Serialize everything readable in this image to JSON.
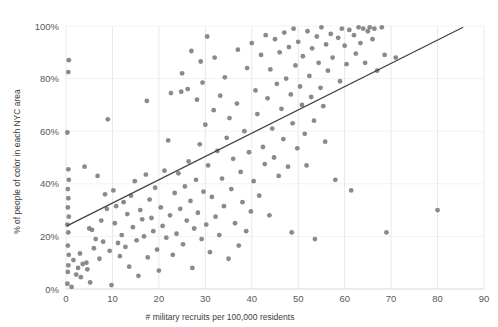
{
  "chart_data": {
    "type": "scatter",
    "title": "",
    "xlabel": "# military recruits per 100,000 residents",
    "ylabel": "% of people of color in each NYC area",
    "xlim": [
      0,
      90
    ],
    "ylim": [
      0,
      100
    ],
    "xticks": [
      0,
      10,
      20,
      30,
      40,
      50,
      60,
      70,
      80,
      90
    ],
    "xtick_labels": [
      "0",
      "10",
      "20",
      "30",
      "40",
      "50",
      "60",
      "70",
      "80",
      "90"
    ],
    "yticks": [
      0,
      20,
      40,
      60,
      80,
      100
    ],
    "ytick_labels": [
      "0%",
      "20%",
      "40%",
      "60%",
      "80%",
      "100%"
    ],
    "grid": {
      "vertical": true,
      "horizontal": true
    },
    "legend": null,
    "marker": {
      "shape": "circle",
      "color": "#808080",
      "size": 2.4
    },
    "trendline": {
      "type": "linear",
      "color": "#3f3f3f",
      "x_start": 0.2,
      "y_start": 24.0,
      "x_end": 85.5,
      "y_end": 99.5
    },
    "point_count": 201,
    "points": [
      [
        0.3,
        2.0
      ],
      [
        0.4,
        6.5
      ],
      [
        0.5,
        9.0
      ],
      [
        0.6,
        13.0
      ],
      [
        0.4,
        16.5
      ],
      [
        0.5,
        21.5
      ],
      [
        0.3,
        24.5
      ],
      [
        0.6,
        27.5
      ],
      [
        0.4,
        31.0
      ],
      [
        0.5,
        34.5
      ],
      [
        0.4,
        38.0
      ],
      [
        0.6,
        41.5
      ],
      [
        0.5,
        45.5
      ],
      [
        0.3,
        59.5
      ],
      [
        0.5,
        82.5
      ],
      [
        0.6,
        87.0
      ],
      [
        1.2,
        0.8
      ],
      [
        1.6,
        11.0
      ],
      [
        2.2,
        5.5
      ],
      [
        2.6,
        8.0
      ],
      [
        3.0,
        13.5
      ],
      [
        3.2,
        4.5
      ],
      [
        3.6,
        9.5
      ],
      [
        4.0,
        46.5
      ],
      [
        4.4,
        10.0
      ],
      [
        4.6,
        7.5
      ],
      [
        5.0,
        23.0
      ],
      [
        5.2,
        2.5
      ],
      [
        5.6,
        22.5
      ],
      [
        6.0,
        15.5
      ],
      [
        6.4,
        19.0
      ],
      [
        6.8,
        43.0
      ],
      [
        7.2,
        11.5
      ],
      [
        7.6,
        26.0
      ],
      [
        8.0,
        18.0
      ],
      [
        8.4,
        36.0
      ],
      [
        8.8,
        30.5
      ],
      [
        9.0,
        64.5
      ],
      [
        9.4,
        14.5
      ],
      [
        9.8,
        1.5
      ],
      [
        10.2,
        37.5
      ],
      [
        10.5,
        25.0
      ],
      [
        10.8,
        31.5
      ],
      [
        11.2,
        17.5
      ],
      [
        11.6,
        12.5
      ],
      [
        12.0,
        20.5
      ],
      [
        12.4,
        33.0
      ],
      [
        12.8,
        16.0
      ],
      [
        13.2,
        28.5
      ],
      [
        13.6,
        8.5
      ],
      [
        14.0,
        35.5
      ],
      [
        14.4,
        23.5
      ],
      [
        14.8,
        41.0
      ],
      [
        15.2,
        18.5
      ],
      [
        15.6,
        5.0
      ],
      [
        16.0,
        30.0
      ],
      [
        16.4,
        26.5
      ],
      [
        16.8,
        20.0
      ],
      [
        17.2,
        43.5
      ],
      [
        17.4,
        71.5
      ],
      [
        17.6,
        12.0
      ],
      [
        18.0,
        34.0
      ],
      [
        18.4,
        27.0
      ],
      [
        18.8,
        22.0
      ],
      [
        19.2,
        38.5
      ],
      [
        19.6,
        15.0
      ],
      [
        20.0,
        7.0
      ],
      [
        20.4,
        31.0
      ],
      [
        20.8,
        24.0
      ],
      [
        21.2,
        45.0
      ],
      [
        21.6,
        19.5
      ],
      [
        22.0,
        56.5
      ],
      [
        22.4,
        28.0
      ],
      [
        22.6,
        74.5
      ],
      [
        23.0,
        13.0
      ],
      [
        23.4,
        36.5
      ],
      [
        23.8,
        21.0
      ],
      [
        24.2,
        44.0
      ],
      [
        24.6,
        30.5
      ],
      [
        24.8,
        75.0
      ],
      [
        25.0,
        82.0
      ],
      [
        25.2,
        17.0
      ],
      [
        25.6,
        39.0
      ],
      [
        26.0,
        26.0
      ],
      [
        26.2,
        76.0
      ],
      [
        26.4,
        48.5
      ],
      [
        26.8,
        33.5
      ],
      [
        27.0,
        90.5
      ],
      [
        27.2,
        8.0
      ],
      [
        27.6,
        23.0
      ],
      [
        28.0,
        41.5
      ],
      [
        28.2,
        72.0
      ],
      [
        28.4,
        29.0
      ],
      [
        28.8,
        55.0
      ],
      [
        29.0,
        86.5
      ],
      [
        29.2,
        19.0
      ],
      [
        29.4,
        78.5
      ],
      [
        29.6,
        37.0
      ],
      [
        30.0,
        62.5
      ],
      [
        30.2,
        24.5
      ],
      [
        30.4,
        96.0
      ],
      [
        30.6,
        47.0
      ],
      [
        31.0,
        14.0
      ],
      [
        31.4,
        35.0
      ],
      [
        31.8,
        68.0
      ],
      [
        32.0,
        88.0
      ],
      [
        32.2,
        27.5
      ],
      [
        32.6,
        52.5
      ],
      [
        33.0,
        20.5
      ],
      [
        33.2,
        73.5
      ],
      [
        33.6,
        42.0
      ],
      [
        34.0,
        31.5
      ],
      [
        34.2,
        80.5
      ],
      [
        34.6,
        57.5
      ],
      [
        35.0,
        11.5
      ],
      [
        35.2,
        65.0
      ],
      [
        35.6,
        38.0
      ],
      [
        36.0,
        49.5
      ],
      [
        36.4,
        25.0
      ],
      [
        36.8,
        70.5
      ],
      [
        37.0,
        91.0
      ],
      [
        37.2,
        16.5
      ],
      [
        37.6,
        44.5
      ],
      [
        38.0,
        33.0
      ],
      [
        38.4,
        60.0
      ],
      [
        38.8,
        22.0
      ],
      [
        39.0,
        84.0
      ],
      [
        39.4,
        52.0
      ],
      [
        39.8,
        29.5
      ],
      [
        40.0,
        93.5
      ],
      [
        40.4,
        41.0
      ],
      [
        40.8,
        75.5
      ],
      [
        41.2,
        66.5
      ],
      [
        41.6,
        35.5
      ],
      [
        42.0,
        89.0
      ],
      [
        42.4,
        54.0
      ],
      [
        42.8,
        47.5
      ],
      [
        43.0,
        96.5
      ],
      [
        43.4,
        72.5
      ],
      [
        43.8,
        28.0
      ],
      [
        44.0,
        83.5
      ],
      [
        44.4,
        61.0
      ],
      [
        44.8,
        50.0
      ],
      [
        45.0,
        95.0
      ],
      [
        45.4,
        78.0
      ],
      [
        45.8,
        43.0
      ],
      [
        46.0,
        90.0
      ],
      [
        46.4,
        68.5
      ],
      [
        46.8,
        57.0
      ],
      [
        47.0,
        97.5
      ],
      [
        47.4,
        80.0
      ],
      [
        47.8,
        46.5
      ],
      [
        48.0,
        92.0
      ],
      [
        48.4,
        74.0
      ],
      [
        48.6,
        21.5
      ],
      [
        48.8,
        63.0
      ],
      [
        49.0,
        99.0
      ],
      [
        49.4,
        85.0
      ],
      [
        49.8,
        53.5
      ],
      [
        50.0,
        94.0
      ],
      [
        50.4,
        77.0
      ],
      [
        50.8,
        70.0
      ],
      [
        51.0,
        88.5
      ],
      [
        51.4,
        59.0
      ],
      [
        51.8,
        47.0
      ],
      [
        52.0,
        98.0
      ],
      [
        52.4,
        81.0
      ],
      [
        52.8,
        73.0
      ],
      [
        53.0,
        91.5
      ],
      [
        53.4,
        64.0
      ],
      [
        53.6,
        19.0
      ],
      [
        54.0,
        96.0
      ],
      [
        54.4,
        86.0
      ],
      [
        54.8,
        76.5
      ],
      [
        55.0,
        99.5
      ],
      [
        55.4,
        69.5
      ],
      [
        55.8,
        56.0
      ],
      [
        56.0,
        93.0
      ],
      [
        56.4,
        83.0
      ],
      [
        57.0,
        97.0
      ],
      [
        57.4,
        88.0
      ],
      [
        58.0,
        41.5
      ],
      [
        58.6,
        95.5
      ],
      [
        59.0,
        79.0
      ],
      [
        59.4,
        99.0
      ],
      [
        60.0,
        92.5
      ],
      [
        60.4,
        85.5
      ],
      [
        61.0,
        98.5
      ],
      [
        61.4,
        37.5
      ],
      [
        62.0,
        96.5
      ],
      [
        62.4,
        89.5
      ],
      [
        63.0,
        99.5
      ],
      [
        63.4,
        93.5
      ],
      [
        64.0,
        99.0
      ],
      [
        64.4,
        86.0
      ],
      [
        65.0,
        98.0
      ],
      [
        65.4,
        99.5
      ],
      [
        66.0,
        95.0
      ],
      [
        66.4,
        99.0
      ],
      [
        67.0,
        83.0
      ],
      [
        68.0,
        99.5
      ],
      [
        68.6,
        89.0
      ],
      [
        69.0,
        21.5
      ],
      [
        71.0,
        88.0
      ],
      [
        80.0,
        30.0
      ]
    ]
  }
}
